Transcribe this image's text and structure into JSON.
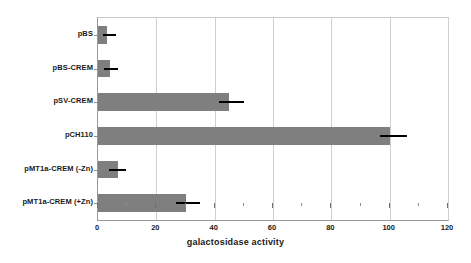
{
  "chart_data": {
    "type": "bar",
    "orientation": "horizontal",
    "title": "",
    "xlabel": "galactosidase activity",
    "ylabel": "",
    "xlim": [
      0,
      120
    ],
    "xticks": [
      0,
      20,
      40,
      60,
      80,
      100,
      120
    ],
    "xtick_labels": [
      "0",
      "20",
      "40",
      "60",
      "80",
      "100",
      "120"
    ],
    "minor_tick_step": 10,
    "grid": "vertical",
    "legend": "none",
    "bar_color": "#7f7f7f",
    "error_color": "#000000",
    "categories": [
      "pBS",
      "pBS-CREM",
      "pSV-CREM",
      "pCH110",
      "pMT1a-CREM (-Zn)",
      "pMT1a-CREM (+Zn)"
    ],
    "values": [
      3,
      4,
      45,
      100,
      7,
      30
    ],
    "error_high": [
      6,
      7,
      50,
      106,
      9.5,
      35
    ],
    "bars": [
      {
        "category": "pBS",
        "value": 3,
        "error_high": 6
      },
      {
        "category": "pBS-CREM",
        "value": 4,
        "error_high": 7
      },
      {
        "category": "pSV-CREM",
        "value": 45,
        "error_high": 50
      },
      {
        "category": "pCH110",
        "value": 100,
        "error_high": 106
      },
      {
        "category": "pMT1a-CREM (-Zn)",
        "value": 7,
        "error_high": 9.5
      },
      {
        "category": "pMT1a-CREM (+Zn)",
        "value": 30,
        "error_high": 35
      }
    ]
  }
}
